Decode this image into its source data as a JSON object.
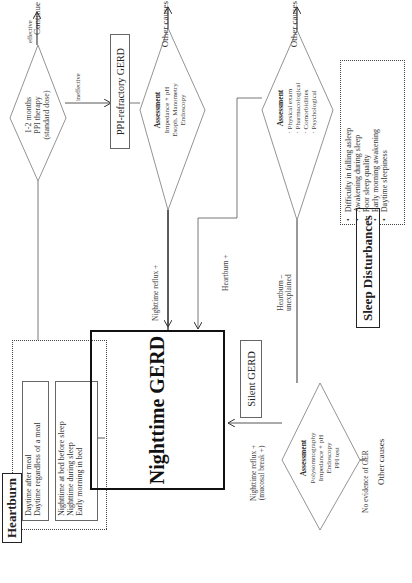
{
  "diagram": {
    "orientation": "rotated 90 degrees counter-clockwise",
    "heartburn": {
      "title": "Heartburn",
      "daytime_items": [
        "Daytime after meal",
        "Daytime regardless of a meal"
      ],
      "nighttime_items": [
        "Nighttime at bed before sleep",
        "Nighttime during sleep",
        "Early morning in bed"
      ]
    },
    "ppi_decision": {
      "lines": [
        "1-2 months",
        "PPI therapy",
        "(standard dose)"
      ],
      "effective_label": "effective",
      "ineffective_label": "ineffective",
      "effective_outcome": "Continue treatment"
    },
    "ppi_refractory": {
      "label": "PPI-refractory GERD"
    },
    "assessment_refractory": {
      "title": "Assessment",
      "lines": [
        "Impedance + pH",
        "Esoph. Manometry",
        "Endoscopy"
      ],
      "outcome": "Other causes",
      "edge_label": "Nighttime reflux +"
    },
    "assessment_clinical": {
      "title": "Assessment",
      "lines": [
        "· Physical exam",
        "· Pharmacological",
        "· Comorbidities",
        "· Psychological"
      ],
      "outcome": "Other causes",
      "edge_label_positive": "Heartburn +",
      "edge_label_unexplained": [
        "Heartburn –",
        "unexplained"
      ]
    },
    "nighttime_gerd": {
      "label": "Nighttime GERD"
    },
    "silent_gerd": {
      "label": "Silent GERD"
    },
    "assessment_silent": {
      "title": "Assessment",
      "lines": [
        "Polysomnography",
        "Impedance + pH",
        "Endoscopy",
        "PPI test"
      ],
      "edge_label": [
        "Nighttime reflux +",
        "(mucosal break +)"
      ],
      "no_evidence_label": "No evidence of GER",
      "outcome": "Other causes"
    },
    "sleep_disturbances": {
      "title": "Sleep Disturbances",
      "items": [
        "Difficulty in falling asleep",
        "Awakening during sleep",
        "Poor sleep quality",
        "Early morning awakening",
        "Daytime sleepiness"
      ]
    }
  }
}
